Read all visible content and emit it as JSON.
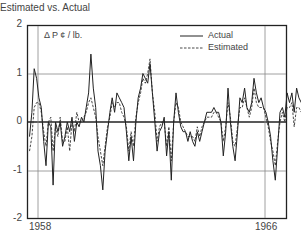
{
  "chart_data": {
    "type": "line",
    "title": "Estimated vs. Actual",
    "unit_label": "Δ P ¢ / lb.",
    "xlabel": "",
    "ylabel": "Δ P ¢ / lb.",
    "ylim": [
      -2,
      2
    ],
    "yticks": [
      "2",
      "1",
      "0",
      "-1",
      "-2"
    ],
    "xticks": [
      "1958",
      "1966"
    ],
    "grid": true,
    "legend_position": "upper right",
    "x_start": 1957.7,
    "x_step": 0.0833,
    "series": [
      {
        "name": "Actual",
        "style": "solid",
        "values": [
          -0.3,
          0.2,
          1.1,
          0.9,
          0.5,
          0.3,
          -0.4,
          -0.9,
          0.0,
          -0.1,
          -1.3,
          0.0,
          -0.2,
          0.0,
          -0.5,
          -0.3,
          0.0,
          -0.2,
          0.1,
          -0.4,
          0.0,
          -0.1,
          0.1,
          0.0,
          0.3,
          0.6,
          1.4,
          0.7,
          0.3,
          -0.6,
          -0.9,
          -1.4,
          -0.6,
          -0.2,
          0.2,
          0.5,
          0.2,
          0.6,
          0.5,
          0.4,
          0.3,
          -0.2,
          -0.8,
          -0.3,
          -0.8,
          0.0,
          0.5,
          0.7,
          1.0,
          0.9,
          0.8,
          1.2,
          0.6,
          0.0,
          -0.6,
          -0.2,
          -0.1,
          0.1,
          -0.7,
          -0.2,
          -1.2,
          0.0,
          0.6,
          0.2,
          -0.1,
          -0.2,
          -0.2,
          -0.4,
          -0.2,
          -0.4,
          -0.5,
          -0.2,
          -0.4,
          -0.2,
          0.0,
          0.2,
          0.2,
          0.2,
          0.3,
          0.2,
          0.2,
          0.0,
          -0.7,
          -0.2,
          0.7,
          0.0,
          -0.5,
          -0.8,
          -0.2,
          0.5,
          0.4,
          0.7,
          0.3,
          0.2,
          0.4,
          0.9,
          0.6,
          0.4,
          0.5,
          0.3,
          0.2,
          0.0,
          -0.3,
          -0.8,
          -1.2,
          -0.5,
          0.2,
          0.3,
          0.1,
          0.6,
          0.4,
          0.6,
          0.2,
          0.7,
          0.5,
          0.4,
          0.3
        ]
      },
      {
        "name": "Estimated",
        "style": "dashed",
        "values": [
          -0.6,
          -0.3,
          0.3,
          0.4,
          0.4,
          0.2,
          -0.2,
          -0.5,
          0.0,
          0.1,
          -0.6,
          -0.1,
          -0.3,
          0.1,
          -0.4,
          -0.4,
          -0.1,
          -0.6,
          0.0,
          -0.2,
          0.2,
          0.0,
          0.0,
          0.1,
          0.2,
          0.4,
          0.5,
          0.3,
          0.1,
          -0.3,
          -0.6,
          -0.9,
          -0.5,
          -0.1,
          0.1,
          0.4,
          0.3,
          0.4,
          0.4,
          0.2,
          0.1,
          -0.1,
          -0.6,
          -0.2,
          -0.5,
          0.1,
          0.4,
          0.6,
          0.9,
          0.8,
          1.0,
          1.3,
          0.6,
          0.2,
          -0.4,
          -0.1,
          0.0,
          0.0,
          -0.5,
          -0.1,
          -0.8,
          0.0,
          0.4,
          0.3,
          0.0,
          -0.1,
          -0.2,
          -0.3,
          -0.3,
          -0.3,
          -0.4,
          -0.1,
          -0.3,
          -0.1,
          0.0,
          0.1,
          0.1,
          0.1,
          0.2,
          0.2,
          0.1,
          0.0,
          -0.4,
          -0.1,
          0.4,
          0.1,
          -0.4,
          -0.5,
          -0.1,
          0.3,
          0.3,
          0.5,
          0.3,
          0.1,
          0.3,
          0.7,
          0.4,
          0.3,
          0.3,
          0.3,
          0.1,
          -0.1,
          -0.4,
          -0.6,
          -0.9,
          -0.4,
          0.0,
          0.2,
          0.0,
          0.3,
          0.3,
          0.4,
          -0.1,
          0.3,
          0.3,
          0.2,
          0.2
        ]
      }
    ]
  }
}
